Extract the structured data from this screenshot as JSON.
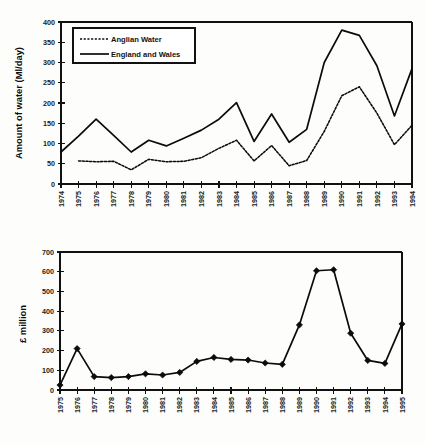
{
  "chart_data": [
    {
      "id": "water-abstraction-chart",
      "type": "line",
      "title": "",
      "xlabel": "",
      "ylabel": "Amount of water (Ml/day)",
      "ylim": [
        0,
        400
      ],
      "ytick_step": 50,
      "yticks": [
        "0",
        "50",
        "100",
        "150",
        "200",
        "250",
        "300",
        "350",
        "400"
      ],
      "grid": false,
      "legend_position": "top-left",
      "categories": [
        "1974",
        "1975",
        "1976",
        "1977",
        "1978",
        "1979",
        "1980",
        "1981",
        "1982",
        "1983",
        "1984",
        "1985",
        "1986",
        "1987",
        "1988",
        "1989",
        "1990",
        "1991",
        "1992",
        "1993",
        "1994"
      ],
      "series": [
        {
          "name": "Anglian Water",
          "style": "dotted",
          "values": [
            null,
            57,
            55,
            56,
            35,
            61,
            55,
            56,
            65,
            88,
            108,
            57,
            95,
            45,
            58,
            130,
            218,
            240,
            175,
            97,
            145
          ]
        },
        {
          "name": "England and Wales",
          "style": "solid",
          "values": [
            79,
            118,
            160,
            120,
            79,
            108,
            94,
            113,
            133,
            160,
            201,
            105,
            173,
            103,
            135,
            300,
            380,
            367,
            292,
            168,
            285
          ]
        }
      ]
    },
    {
      "id": "expenditure-chart",
      "type": "line",
      "title": "",
      "xlabel": "",
      "ylabel": "£ million",
      "ylim": [
        0,
        700
      ],
      "ytick_step": 100,
      "yticks": [
        "0",
        "100",
        "200",
        "300",
        "400",
        "500",
        "600",
        "700"
      ],
      "grid": false,
      "legend_position": "none",
      "categories": [
        "1975",
        "1976",
        "1977",
        "1978",
        "1979",
        "1980",
        "1981",
        "1982",
        "1983",
        "1984",
        "1985",
        "1986",
        "1987",
        "1988",
        "1989",
        "1990",
        "1991",
        "1992",
        "1993",
        "1994",
        "1995"
      ],
      "series": [
        {
          "name": "£ million",
          "style": "solid-markers",
          "values": [
            25,
            210,
            68,
            63,
            68,
            82,
            76,
            89,
            145,
            165,
            155,
            152,
            137,
            130,
            330,
            605,
            610,
            288,
            150,
            135,
            335
          ]
        }
      ]
    }
  ]
}
